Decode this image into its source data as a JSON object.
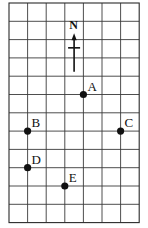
{
  "diagram": {
    "type": "grid-map",
    "grid": {
      "columns": 7,
      "rows": 12,
      "origin_px": [
        9,
        3
      ],
      "cell_width_px": 18.6,
      "cell_height_px": 18.3,
      "line_color": "#3a3a3a"
    },
    "compass": {
      "label": "N",
      "direction": "up",
      "grid_col": 3.5,
      "top_row": 1.65,
      "bottom_row": 3.75,
      "crossbar_row": 2.45
    },
    "points": [
      {
        "label": "A",
        "col": 4,
        "row": 5
      },
      {
        "label": "B",
        "col": 1,
        "row": 7
      },
      {
        "label": "C",
        "col": 6,
        "row": 7
      },
      {
        "label": "D",
        "col": 1,
        "row": 9
      },
      {
        "label": "E",
        "col": 3,
        "row": 10
      }
    ],
    "dot_color": "#111111"
  }
}
